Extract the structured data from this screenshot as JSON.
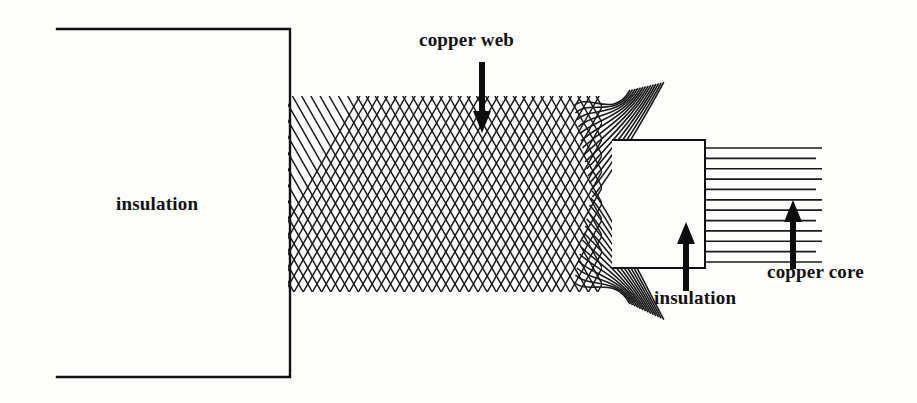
{
  "figure": {
    "background_color": "#fdfdfc",
    "ink_color": "#111111",
    "width": 917,
    "height": 403
  },
  "labels": {
    "outer_insulation": "insulation",
    "copper_web": "copper web",
    "inner_insulation": "insulation",
    "copper_core": "copper core"
  },
  "arrows": {
    "copper_web": {
      "direction": "down",
      "x": 482,
      "from_y": 62,
      "to_y": 131
    },
    "inner_insulation": {
      "direction": "up",
      "x": 686,
      "from_y": 291,
      "to_y": 224
    },
    "copper_core": {
      "direction": "up",
      "x": 793,
      "from_y": 269,
      "to_y": 202
    }
  },
  "geometry": {
    "outer_insulation_rect": {
      "x": 57,
      "y": 29,
      "width": 233,
      "height": 348
    },
    "braid_band": {
      "x": 288,
      "y": 96,
      "width": 325,
      "height": 196
    },
    "braid_strand_count": 46,
    "braid_unravel_x": 602,
    "inner_insulation_rect": {
      "x": 612,
      "y": 140,
      "width": 93,
      "height": 128
    },
    "core_lines": {
      "x_start": 705,
      "x_end": 822,
      "y_top": 148,
      "y_bottom": 262,
      "count": 12
    }
  }
}
